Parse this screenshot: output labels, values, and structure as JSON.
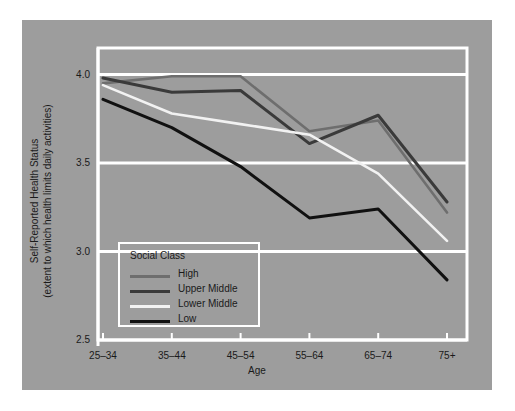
{
  "figure": {
    "background_color": "#ffffff",
    "panel_color": "#9d9d9d",
    "top_artifact_text": ""
  },
  "chart_data": {
    "type": "line",
    "title": "",
    "xlabel": "Age",
    "ylabel": "Self-Reported Health Status",
    "ylabel_line2": "(extent to which health limits daily activities)",
    "categories": [
      "25–34",
      "35–44",
      "45–54",
      "55–64",
      "65–74",
      "75+"
    ],
    "ylim": [
      2.5,
      4.15
    ],
    "yticks": [
      "4.0",
      "3.5",
      "3.0",
      "2.5"
    ],
    "ytick_values": [
      4.0,
      3.5,
      3.0,
      2.5
    ],
    "grid": "horizontal-white",
    "legend_position": "inside-lower-left",
    "legend_title": "Social Class",
    "series": [
      {
        "name": "High",
        "color": "#6e6e6e",
        "values": [
          3.95,
          3.99,
          3.99,
          3.68,
          3.74,
          3.22
        ]
      },
      {
        "name": "Upper Middle",
        "color": "#3a3a3a",
        "values": [
          3.98,
          3.9,
          3.91,
          3.61,
          3.77,
          3.28
        ]
      },
      {
        "name": "Lower Middle",
        "color": "#f2f2f2",
        "values": [
          3.94,
          3.78,
          3.72,
          3.66,
          3.44,
          3.06
        ]
      },
      {
        "name": "Low",
        "color": "#111111",
        "values": [
          3.86,
          3.7,
          3.48,
          3.19,
          3.24,
          2.84
        ]
      }
    ]
  }
}
